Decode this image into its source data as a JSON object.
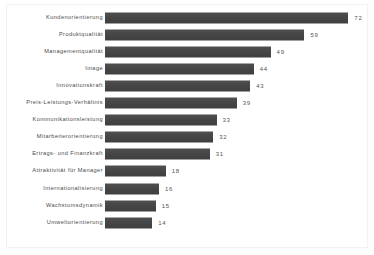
{
  "chart_data": {
    "type": "bar",
    "orientation": "horizontal",
    "title": "",
    "subtitle": "",
    "xlabel": "",
    "ylabel": "",
    "xlim": [
      0,
      72
    ],
    "grid": false,
    "legend": null,
    "bar_color": "#4a4a4a",
    "label_color": "#4a4a4a",
    "value_label_color": "#555555",
    "background_color": "#ffffff",
    "frame_color": "#f2f2f2",
    "categories": [
      "Kundenorientierung",
      "Produktqualität",
      "Managementqualität",
      "Image",
      "Innovationskraft",
      "Preis-Leistungs-Verhältnis",
      "Kommunikationsleistung",
      "Mitarbeiterorientierung",
      "Ertrags- und Finanzkraft",
      "Attraktivität für Manager",
      "Internationalisierung",
      "Wachstumsdynamik",
      "Umweltorientierung"
    ],
    "values": [
      72,
      59,
      49,
      44,
      43,
      39,
      33,
      32,
      31,
      18,
      16,
      15,
      14
    ],
    "value_labels": [
      "72",
      "59",
      "49",
      "44",
      "43",
      "39",
      "33",
      "32",
      "31",
      "18",
      "16",
      "15",
      "14"
    ]
  }
}
